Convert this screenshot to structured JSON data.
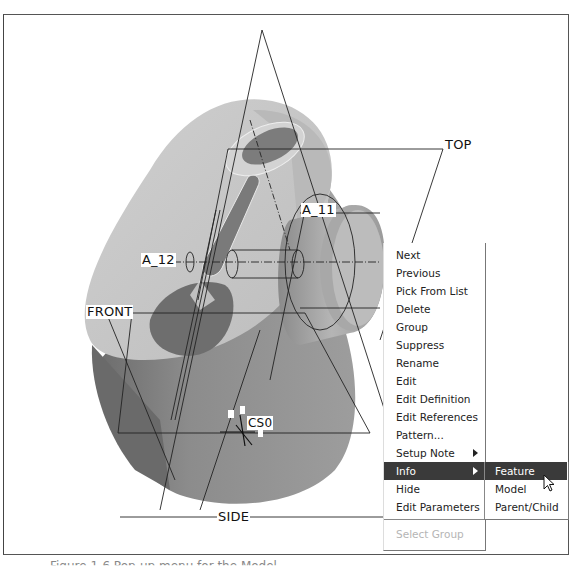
{
  "model": {
    "datum_planes": {
      "top": "TOP",
      "front": "FRONT",
      "side": "SIDE"
    },
    "axes": {
      "a11": "A_11",
      "a12": "A_12"
    },
    "coordinate_system": "CS0"
  },
  "context_menu": {
    "items": [
      {
        "label": "Next"
      },
      {
        "label": "Previous"
      },
      {
        "label": "Pick From List"
      },
      {
        "label": "Delete"
      },
      {
        "label": "Group"
      },
      {
        "label": "Suppress"
      },
      {
        "label": "Rename"
      },
      {
        "label": "Edit"
      },
      {
        "label": "Edit Definition"
      },
      {
        "label": "Edit References"
      },
      {
        "label": "Pattern..."
      },
      {
        "label": "Setup Note",
        "submenu": true
      },
      {
        "label": "Info",
        "submenu": true,
        "selected": true
      },
      {
        "label": "Hide"
      },
      {
        "label": "Edit Parameters"
      }
    ],
    "disabled_item": "Select Group"
  },
  "submenu_info": {
    "items": [
      {
        "label": "Feature",
        "selected": true
      },
      {
        "label": "Model"
      },
      {
        "label": "Parent/Child"
      }
    ]
  },
  "caption": "Figure 1-6 Pop-up menu for the Model"
}
